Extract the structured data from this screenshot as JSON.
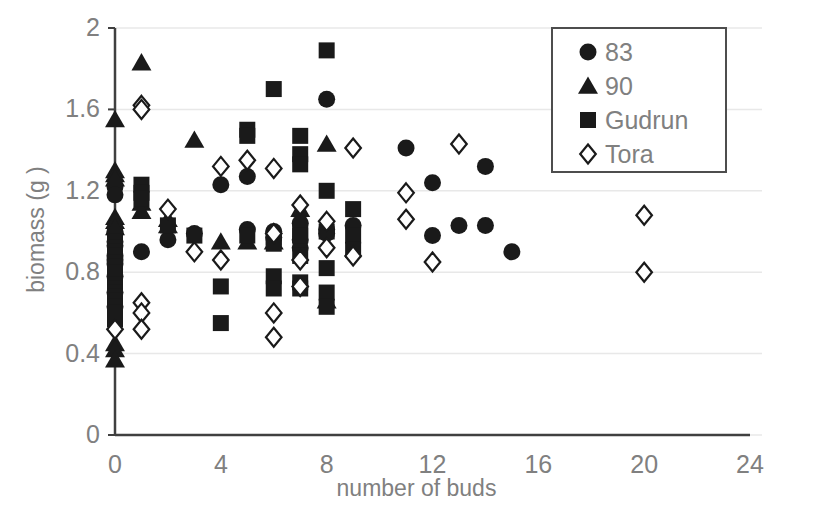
{
  "chart_data": {
    "type": "scatter",
    "title": "",
    "xlabel": "number of buds",
    "ylabel": "biomass (g )",
    "xlim": [
      0,
      24
    ],
    "ylim": [
      0,
      2
    ],
    "xticks": [
      "0",
      "4",
      "8",
      "12",
      "16",
      "20",
      "24"
    ],
    "xtick_values": [
      0,
      4,
      8,
      12,
      16,
      20,
      24
    ],
    "yticks": [
      "0",
      "0.4",
      "0.8",
      "1.2",
      "1.6",
      "2"
    ],
    "ytick_values": [
      0,
      0.4,
      0.8,
      1.2,
      1.6,
      2
    ],
    "grid": "horizontal",
    "grid_color": "#e8e8e8",
    "axis_color": "#404040",
    "marker_color": "#1a1a1a",
    "legend_position": "top-right",
    "series": [
      {
        "name": "83",
        "marker": "circle",
        "filled": true,
        "color": "#1a1a1a",
        "points": [
          [
            0,
            1.22
          ],
          [
            0,
            1.18
          ],
          [
            0,
            1.0
          ],
          [
            0,
            0.99
          ],
          [
            0,
            0.95
          ],
          [
            0,
            0.93
          ],
          [
            0,
            0.88
          ],
          [
            0,
            0.86
          ],
          [
            0,
            0.84
          ],
          [
            0,
            0.78
          ],
          [
            0,
            0.7
          ],
          [
            0,
            0.63
          ],
          [
            1,
            0.9
          ],
          [
            2,
            0.96
          ],
          [
            3,
            0.99
          ],
          [
            4,
            1.23
          ],
          [
            5,
            1.27
          ],
          [
            5,
            1.01
          ],
          [
            6,
            1.0
          ],
          [
            6,
            0.97
          ],
          [
            7,
            1.04
          ],
          [
            7,
            0.96
          ],
          [
            7,
            0.92
          ],
          [
            8,
            1.65
          ],
          [
            8,
            1.01
          ],
          [
            8,
            0.99
          ],
          [
            9,
            1.03
          ],
          [
            11,
            1.41
          ],
          [
            12,
            1.24
          ],
          [
            12,
            0.98
          ],
          [
            13,
            1.03
          ],
          [
            14,
            1.32
          ],
          [
            14,
            1.03
          ],
          [
            15,
            0.9
          ]
        ]
      },
      {
        "name": "90",
        "marker": "triangle",
        "filled": true,
        "color": "#1a1a1a",
        "points": [
          [
            0,
            1.55
          ],
          [
            0,
            1.3
          ],
          [
            0,
            1.28
          ],
          [
            0,
            1.26
          ],
          [
            0,
            1.07
          ],
          [
            0,
            1.05
          ],
          [
            0,
            1.02
          ],
          [
            0,
            0.45
          ],
          [
            0,
            0.42
          ],
          [
            0,
            0.37
          ],
          [
            1,
            1.83
          ],
          [
            1,
            1.14
          ],
          [
            1,
            1.1
          ],
          [
            2,
            1.06
          ],
          [
            2,
            1.03
          ],
          [
            3,
            1.45
          ],
          [
            4,
            0.95
          ],
          [
            5,
            0.95
          ],
          [
            6,
            0.95
          ],
          [
            7,
            1.11
          ],
          [
            8,
            1.43
          ],
          [
            8,
            0.66
          ]
        ]
      },
      {
        "name": "Gudrun",
        "marker": "square",
        "filled": true,
        "color": "#1a1a1a",
        "points": [
          [
            0,
            0.95
          ],
          [
            0,
            0.92
          ],
          [
            0,
            0.9
          ],
          [
            0,
            0.88
          ],
          [
            0,
            0.85
          ],
          [
            0,
            0.83
          ],
          [
            0,
            0.8
          ],
          [
            0,
            0.78
          ],
          [
            0,
            0.74
          ],
          [
            0,
            0.72
          ],
          [
            0,
            0.7
          ],
          [
            0,
            0.68
          ],
          [
            0,
            0.66
          ],
          [
            0,
            0.63
          ],
          [
            0,
            0.6
          ],
          [
            0,
            0.57
          ],
          [
            1,
            1.23
          ],
          [
            1,
            1.19
          ],
          [
            1,
            1.16
          ],
          [
            2,
            1.03
          ],
          [
            3,
            0.98
          ],
          [
            4,
            0.73
          ],
          [
            4,
            0.55
          ],
          [
            5,
            1.5
          ],
          [
            5,
            1.47
          ],
          [
            5,
            0.98
          ],
          [
            6,
            1.7
          ],
          [
            6,
            0.97
          ],
          [
            6,
            0.94
          ],
          [
            6,
            0.78
          ],
          [
            6,
            0.72
          ],
          [
            7,
            1.47
          ],
          [
            7,
            1.38
          ],
          [
            7,
            1.33
          ],
          [
            7,
            1.01
          ],
          [
            7,
            0.98
          ],
          [
            7,
            0.88
          ],
          [
            7,
            0.75
          ],
          [
            7,
            0.72
          ],
          [
            8,
            1.89
          ],
          [
            8,
            1.2
          ],
          [
            8,
            1.0
          ],
          [
            8,
            0.82
          ],
          [
            8,
            0.7
          ],
          [
            8,
            0.63
          ],
          [
            9,
            1.11
          ],
          [
            9,
            0.98
          ],
          [
            9,
            0.91
          ]
        ]
      },
      {
        "name": "Tora",
        "marker": "diamond",
        "filled": false,
        "color": "#1a1a1a",
        "points": [
          [
            0,
            0.52
          ],
          [
            1,
            1.62
          ],
          [
            1,
            1.6
          ],
          [
            1,
            0.65
          ],
          [
            1,
            0.6
          ],
          [
            1,
            0.52
          ],
          [
            2,
            1.11
          ],
          [
            3,
            0.9
          ],
          [
            4,
            1.32
          ],
          [
            4,
            0.86
          ],
          [
            5,
            1.35
          ],
          [
            6,
            1.31
          ],
          [
            6,
            0.99
          ],
          [
            6,
            0.6
          ],
          [
            6,
            0.48
          ],
          [
            7,
            1.13
          ],
          [
            7,
            0.86
          ],
          [
            7,
            0.73
          ],
          [
            8,
            1.05
          ],
          [
            8,
            0.92
          ],
          [
            9,
            1.41
          ],
          [
            9,
            0.88
          ],
          [
            11,
            1.19
          ],
          [
            11,
            1.06
          ],
          [
            13,
            1.43
          ],
          [
            12,
            0.85
          ],
          [
            20,
            1.08
          ],
          [
            20,
            0.8
          ]
        ]
      }
    ]
  },
  "legend": {
    "items": [
      {
        "label": "83",
        "marker": "circle"
      },
      {
        "label": "90",
        "marker": "triangle"
      },
      {
        "label": "Gudrun",
        "marker": "square"
      },
      {
        "label": "Tora",
        "marker": "diamond"
      }
    ]
  }
}
